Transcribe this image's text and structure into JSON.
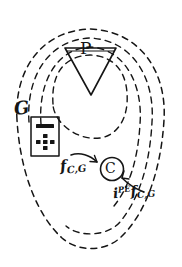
{
  "figure": {
    "background_color": "#ffffff",
    "ink_color": "#151515",
    "width": 182,
    "height": 267
  },
  "contours": {
    "name": "nested-dashed-contours",
    "count": 4,
    "style": "dashed",
    "description": "four nested open teardrop-shaped dashed curves"
  },
  "nodes": {
    "source_triangle": {
      "label": "P",
      "shape": "inverted-triangle"
    },
    "collector_circle": {
      "label": "C",
      "shape": "circle"
    },
    "device_box": {
      "shape": "rectangle",
      "contents": "minus-bar-and-plus-dots"
    }
  },
  "labels": {
    "ground": "G",
    "flux_out": {
      "symbol": "f",
      "subscript": "C,G",
      "superscript": "",
      "prefix": ""
    },
    "flux_in": {
      "symbol": "f",
      "subscript": "C,G",
      "superscript": "PE",
      "prefix": "i"
    }
  },
  "arrows": {
    "out_arrow": "arrow-pointing-right-into-C",
    "in_arrow": "arrow-pointing-up-left-into-C"
  }
}
